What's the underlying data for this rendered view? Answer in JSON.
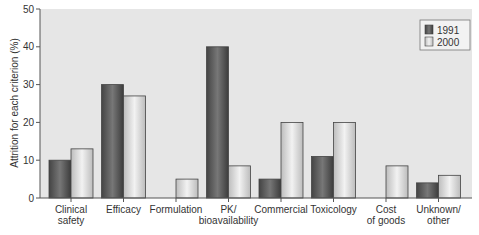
{
  "chart_data": {
    "type": "bar",
    "title": "",
    "xlabel": "",
    "ylabel": "Attrition for each criterion (%)",
    "ylim": [
      0,
      50
    ],
    "yticks": [
      0,
      10,
      20,
      30,
      40,
      50
    ],
    "grid": false,
    "legend_position": "upper right",
    "categories": [
      [
        "Clinical",
        "safety"
      ],
      [
        "Efficacy"
      ],
      [
        "Formulation"
      ],
      [
        "PK/",
        "bioavailability"
      ],
      [
        "Commercial"
      ],
      [
        "Toxicology"
      ],
      [
        "Cost",
        "of goods"
      ],
      [
        "Unknown/",
        "other"
      ]
    ],
    "series": [
      {
        "name": "1991",
        "color": "#5a5a5a",
        "values": [
          10,
          30,
          0,
          40,
          5,
          11,
          0,
          4
        ]
      },
      {
        "name": "2000",
        "color": "#d8d8d8",
        "values": [
          13,
          27,
          5,
          8.5,
          20,
          20,
          8.5,
          6
        ]
      }
    ]
  }
}
